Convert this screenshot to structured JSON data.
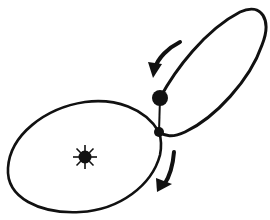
{
  "diagram": {
    "type": "orbital-transfer",
    "colors": {
      "ink": "#111111",
      "background": "#ffffff"
    },
    "elements": {
      "sun": {
        "label": "sun",
        "cx": 85,
        "cy": 157
      },
      "inner_orbit": {
        "label": "large orbit around sun"
      },
      "outer_orbit": {
        "label": "elongated orbit"
      },
      "planet_large": {
        "label": "large body",
        "cx": 160,
        "cy": 98
      },
      "planet_small": {
        "label": "small body at orbit junction",
        "cx": 159,
        "cy": 132
      },
      "arrow_upper": {
        "label": "direction arrow (downward-left)"
      },
      "arrow_lower": {
        "label": "direction arrow (downward)"
      }
    }
  }
}
